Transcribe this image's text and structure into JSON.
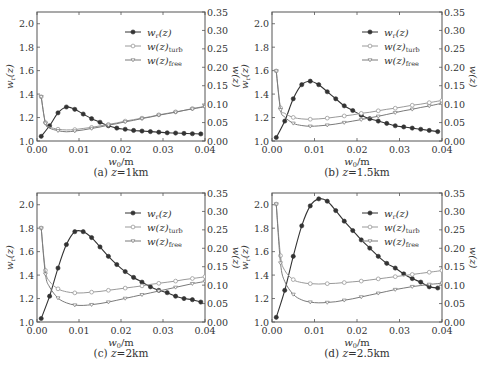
{
  "figure": {
    "panels_layout": "2x2"
  },
  "chart_data": [
    {
      "type": "line",
      "caption": "(a) z=1km",
      "caption_prefix": "(a)",
      "caption_var": "z",
      "caption_value": "=1km",
      "xlabel": "w0/m",
      "ylabel_left": "wr(z)",
      "ylabel_right": "w(z)",
      "xlim": [
        0,
        0.04
      ],
      "xticks": [
        "0.00",
        "0.01",
        "0.02",
        "0.03",
        "0.04"
      ],
      "ylim_left": [
        1.0,
        2.1
      ],
      "yticks_left": [
        "1.0",
        "1.2",
        "1.4",
        "1.6",
        "1.8",
        "2.0"
      ],
      "ylim_right": [
        0,
        0.35
      ],
      "yticks_right": [
        "0.00",
        "0.05",
        "0.10",
        "0.15",
        "0.20",
        "0.25",
        "0.30",
        "0.35"
      ],
      "legend": [
        "w_r(z)",
        "w(z)_turb",
        "w(z)_free"
      ],
      "legend_position": "upper right",
      "grid": false,
      "series": [
        {
          "name": "w_r(z)",
          "axis": "left",
          "marker": "filled-circle",
          "x": [
            0.001,
            0.003,
            0.005,
            0.007,
            0.009,
            0.011,
            0.013,
            0.015,
            0.017,
            0.019,
            0.021,
            0.023,
            0.025,
            0.027,
            0.029,
            0.031,
            0.033,
            0.035,
            0.037,
            0.039
          ],
          "values": [
            1.04,
            1.13,
            1.24,
            1.29,
            1.27,
            1.23,
            1.19,
            1.16,
            1.13,
            1.11,
            1.1,
            1.09,
            1.085,
            1.08,
            1.075,
            1.07,
            1.068,
            1.065,
            1.062,
            1.06
          ]
        },
        {
          "name": "w(z)_turb",
          "axis": "right",
          "marker": "open-circle",
          "x": [
            0.001,
            0.002,
            0.003,
            0.005,
            0.007,
            0.009,
            0.011,
            0.013,
            0.015,
            0.017,
            0.019,
            0.021,
            0.023,
            0.025,
            0.027,
            0.029,
            0.031,
            0.033,
            0.035,
            0.037,
            0.039,
            0.04
          ],
          "values": [
            0.12,
            0.05,
            0.038,
            0.032,
            0.03,
            0.031,
            0.034,
            0.037,
            0.041,
            0.045,
            0.049,
            0.054,
            0.058,
            0.062,
            0.066,
            0.071,
            0.075,
            0.079,
            0.083,
            0.088,
            0.092,
            0.094
          ]
        },
        {
          "name": "w(z)_free",
          "axis": "right",
          "marker": "triangle",
          "x": [
            0.001,
            0.002,
            0.003,
            0.005,
            0.007,
            0.009,
            0.011,
            0.013,
            0.015,
            0.017,
            0.019,
            0.021,
            0.023,
            0.025,
            0.027,
            0.029,
            0.031,
            0.033,
            0.035,
            0.037,
            0.039,
            0.04
          ],
          "values": [
            0.12,
            0.048,
            0.035,
            0.028,
            0.025,
            0.027,
            0.03,
            0.034,
            0.038,
            0.043,
            0.047,
            0.052,
            0.056,
            0.061,
            0.065,
            0.07,
            0.074,
            0.078,
            0.083,
            0.087,
            0.091,
            0.093
          ]
        }
      ]
    },
    {
      "type": "line",
      "caption": "(b) z=1.5km",
      "caption_prefix": "(b)",
      "caption_var": "z",
      "caption_value": "=1.5km",
      "xlabel": "w0/m",
      "ylabel_left": "wr(z)",
      "ylabel_right": "w(z)",
      "xlim": [
        0,
        0.04
      ],
      "xticks": [
        "0.00",
        "0.01",
        "0.02",
        "0.03",
        "0.04"
      ],
      "ylim_left": [
        1.0,
        2.1
      ],
      "yticks_left": [
        "1.0",
        "1.2",
        "1.4",
        "1.6",
        "1.8",
        "2.0"
      ],
      "ylim_right": [
        0,
        0.35
      ],
      "yticks_right": [
        "0.00",
        "0.05",
        "0.10",
        "0.15",
        "0.20",
        "0.25",
        "0.30",
        "0.35"
      ],
      "legend": [
        "w_r(z)",
        "w(z)_turb",
        "w(z)_free"
      ],
      "legend_position": "upper right",
      "grid": false,
      "series": [
        {
          "name": "w_r(z)",
          "axis": "left",
          "marker": "filled-circle",
          "x": [
            0.001,
            0.003,
            0.005,
            0.007,
            0.009,
            0.011,
            0.013,
            0.015,
            0.017,
            0.019,
            0.021,
            0.023,
            0.025,
            0.027,
            0.029,
            0.031,
            0.033,
            0.035,
            0.037,
            0.039
          ],
          "values": [
            1.03,
            1.17,
            1.36,
            1.48,
            1.51,
            1.48,
            1.42,
            1.36,
            1.3,
            1.26,
            1.22,
            1.19,
            1.17,
            1.15,
            1.13,
            1.12,
            1.11,
            1.1,
            1.09,
            1.08
          ]
        },
        {
          "name": "w(z)_turb",
          "axis": "right",
          "marker": "open-circle",
          "x": [
            0.001,
            0.002,
            0.003,
            0.005,
            0.007,
            0.009,
            0.011,
            0.013,
            0.015,
            0.017,
            0.019,
            0.021,
            0.023,
            0.025,
            0.027,
            0.029,
            0.031,
            0.033,
            0.035,
            0.037,
            0.039,
            0.04
          ],
          "values": [
            0.19,
            0.09,
            0.075,
            0.064,
            0.06,
            0.059,
            0.06,
            0.062,
            0.065,
            0.068,
            0.071,
            0.075,
            0.078,
            0.082,
            0.086,
            0.089,
            0.093,
            0.097,
            0.1,
            0.104,
            0.108,
            0.11
          ]
        },
        {
          "name": "w(z)_free",
          "axis": "right",
          "marker": "triangle",
          "x": [
            0.001,
            0.002,
            0.003,
            0.005,
            0.007,
            0.009,
            0.011,
            0.013,
            0.015,
            0.017,
            0.019,
            0.021,
            0.023,
            0.025,
            0.027,
            0.029,
            0.031,
            0.033,
            0.035,
            0.037,
            0.039,
            0.04
          ],
          "values": [
            0.19,
            0.085,
            0.065,
            0.048,
            0.042,
            0.04,
            0.041,
            0.043,
            0.046,
            0.05,
            0.054,
            0.058,
            0.063,
            0.067,
            0.072,
            0.077,
            0.082,
            0.086,
            0.091,
            0.095,
            0.1,
            0.102
          ]
        }
      ]
    },
    {
      "type": "line",
      "caption": "(c) z=2km",
      "caption_prefix": "(c)",
      "caption_var": "z",
      "caption_value": "=2km",
      "xlabel": "w0/m",
      "ylabel_left": "wr(z)",
      "ylabel_right": "w(z)",
      "xlim": [
        0,
        0.04
      ],
      "xticks": [
        "0.00",
        "0.01",
        "0.02",
        "0.03",
        "0.04"
      ],
      "ylim_left": [
        1.0,
        2.1
      ],
      "yticks_left": [
        "1.0",
        "1.2",
        "1.4",
        "1.6",
        "1.8",
        "2.0"
      ],
      "ylim_right": [
        0,
        0.35
      ],
      "yticks_right": [
        "0.00",
        "0.05",
        "0.10",
        "0.15",
        "0.20",
        "0.25",
        "0.30",
        "0.35"
      ],
      "legend": [
        "w_r(z)",
        "w(z)_turb",
        "w(z)_free"
      ],
      "legend_position": "upper right",
      "grid": false,
      "series": [
        {
          "name": "w_r(z)",
          "axis": "left",
          "marker": "filled-circle",
          "x": [
            0.001,
            0.003,
            0.005,
            0.007,
            0.009,
            0.011,
            0.013,
            0.015,
            0.017,
            0.019,
            0.021,
            0.023,
            0.025,
            0.027,
            0.029,
            0.031,
            0.033,
            0.035,
            0.037,
            0.039
          ],
          "values": [
            1.03,
            1.22,
            1.46,
            1.66,
            1.77,
            1.77,
            1.72,
            1.64,
            1.56,
            1.49,
            1.43,
            1.38,
            1.34,
            1.3,
            1.27,
            1.25,
            1.22,
            1.2,
            1.19,
            1.17
          ]
        },
        {
          "name": "w(z)_turb",
          "axis": "right",
          "marker": "open-circle",
          "x": [
            0.001,
            0.002,
            0.003,
            0.005,
            0.007,
            0.009,
            0.011,
            0.013,
            0.015,
            0.017,
            0.019,
            0.021,
            0.023,
            0.025,
            0.027,
            0.029,
            0.031,
            0.033,
            0.035,
            0.037,
            0.039,
            0.04
          ],
          "values": [
            0.255,
            0.14,
            0.11,
            0.09,
            0.082,
            0.079,
            0.079,
            0.081,
            0.083,
            0.086,
            0.089,
            0.092,
            0.095,
            0.098,
            0.102,
            0.105,
            0.108,
            0.111,
            0.115,
            0.118,
            0.121,
            0.123
          ]
        },
        {
          "name": "w(z)_free",
          "axis": "right",
          "marker": "triangle",
          "x": [
            0.001,
            0.002,
            0.003,
            0.005,
            0.007,
            0.009,
            0.011,
            0.013,
            0.015,
            0.017,
            0.019,
            0.021,
            0.023,
            0.025,
            0.027,
            0.029,
            0.031,
            0.033,
            0.035,
            0.037,
            0.039,
            0.04
          ],
          "values": [
            0.255,
            0.13,
            0.095,
            0.065,
            0.052,
            0.046,
            0.045,
            0.047,
            0.05,
            0.054,
            0.059,
            0.064,
            0.069,
            0.074,
            0.079,
            0.084,
            0.089,
            0.094,
            0.099,
            0.104,
            0.108,
            0.11
          ]
        }
      ]
    },
    {
      "type": "line",
      "caption": "(d) z=2.5km",
      "caption_prefix": "(d)",
      "caption_var": "z",
      "caption_value": "=2.5km",
      "xlabel": "w0/m",
      "ylabel_left": "wr(z)",
      "ylabel_right": "w(z)",
      "xlim": [
        0,
        0.04
      ],
      "xticks": [
        "0.00",
        "0.01",
        "0.02",
        "0.03",
        "0.04"
      ],
      "ylim_left": [
        1.0,
        2.1
      ],
      "yticks_left": [
        "1.0",
        "1.2",
        "1.4",
        "1.6",
        "1.8",
        "2.0"
      ],
      "ylim_right": [
        0,
        0.35
      ],
      "yticks_right": [
        "0.00",
        "0.05",
        "0.10",
        "0.15",
        "0.20",
        "0.25",
        "0.30",
        "0.35"
      ],
      "legend": [
        "w_r(z)",
        "w(z)_turb",
        "w(z)_free"
      ],
      "legend_position": "upper right",
      "grid": false,
      "series": [
        {
          "name": "w_r(z)",
          "axis": "left",
          "marker": "filled-circle",
          "x": [
            0.001,
            0.003,
            0.005,
            0.007,
            0.009,
            0.011,
            0.013,
            0.015,
            0.017,
            0.019,
            0.021,
            0.023,
            0.025,
            0.027,
            0.029,
            0.031,
            0.033,
            0.035,
            0.037,
            0.039
          ],
          "values": [
            1.04,
            1.27,
            1.56,
            1.82,
            1.99,
            2.05,
            2.03,
            1.95,
            1.86,
            1.78,
            1.7,
            1.63,
            1.56,
            1.5,
            1.46,
            1.41,
            1.37,
            1.34,
            1.3,
            1.29
          ]
        },
        {
          "name": "w(z)_turb",
          "axis": "right",
          "marker": "open-circle",
          "x": [
            0.001,
            0.002,
            0.003,
            0.005,
            0.007,
            0.009,
            0.011,
            0.013,
            0.015,
            0.017,
            0.019,
            0.021,
            0.023,
            0.025,
            0.027,
            0.029,
            0.031,
            0.033,
            0.035,
            0.037,
            0.039,
            0.04
          ],
          "values": [
            0.32,
            0.18,
            0.14,
            0.115,
            0.107,
            0.104,
            0.103,
            0.104,
            0.105,
            0.107,
            0.109,
            0.111,
            0.114,
            0.117,
            0.12,
            0.123,
            0.126,
            0.129,
            0.132,
            0.135,
            0.138,
            0.14
          ]
        },
        {
          "name": "w(z)_free",
          "axis": "right",
          "marker": "triangle",
          "x": [
            0.001,
            0.002,
            0.003,
            0.005,
            0.007,
            0.009,
            0.011,
            0.013,
            0.015,
            0.017,
            0.019,
            0.021,
            0.023,
            0.025,
            0.027,
            0.029,
            0.031,
            0.033,
            0.035,
            0.037,
            0.039,
            0.04
          ],
          "values": [
            0.32,
            0.16,
            0.11,
            0.075,
            0.06,
            0.054,
            0.052,
            0.053,
            0.055,
            0.059,
            0.063,
            0.068,
            0.073,
            0.078,
            0.083,
            0.088,
            0.092,
            0.096,
            0.099,
            0.102,
            0.104,
            0.105
          ]
        }
      ]
    }
  ],
  "style": {
    "wr_color": "#333333",
    "turb_color": "#9a9a9a",
    "free_color": "#7a7a7a",
    "frame_color": "#555555",
    "text_color": "#333333"
  }
}
